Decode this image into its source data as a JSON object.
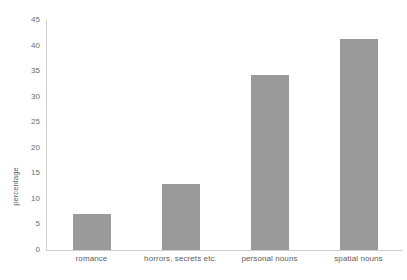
{
  "chart_data": {
    "type": "bar",
    "title": "",
    "subtitle": "",
    "xlabel": "",
    "ylabel": "percentage",
    "categories": [
      "romance",
      "horrors, secrets etc.",
      "personal nouns",
      "spatial nouns"
    ],
    "values": [
      7.1,
      13.0,
      34.3,
      41.3
    ],
    "ylim": [
      0,
      45
    ],
    "yticks": [
      0,
      5,
      10,
      15,
      20,
      25,
      30,
      35,
      40,
      45
    ],
    "ytick_labels": [
      "0",
      "5",
      "10",
      "15",
      "20",
      "25",
      "30",
      "35",
      "40",
      "45"
    ],
    "grid": false,
    "legend": false,
    "legend_position": "none",
    "bar_color": "#9a9a9a",
    "axis_color": "#cfcfcf",
    "text_color": "#5e5e5e"
  }
}
